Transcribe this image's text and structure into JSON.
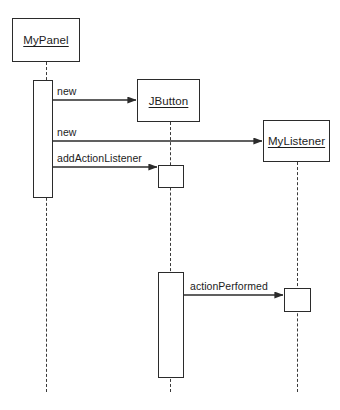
{
  "diagram": {
    "kind": "uml-sequence-diagram",
    "title": "",
    "canvas": {
      "width": 340,
      "height": 410
    },
    "colors": {
      "background": "#ffffff",
      "stroke": "#2b2b2b",
      "lifeline_stroke": "#3a3a3a",
      "text": "#1c1c1c",
      "fill": "#ffffff"
    },
    "participants": [
      {
        "id": "mypanel",
        "label": "MyPanel",
        "underlined": true,
        "box": {
          "x": 12,
          "y": 18,
          "w": 68,
          "h": 44
        },
        "lifeline_x": 46,
        "lifeline_end_y": 392
      },
      {
        "id": "jbutton",
        "label": "JButton",
        "underlined": true,
        "box": {
          "x": 137,
          "y": 79,
          "w": 63,
          "h": 43
        },
        "lifeline_x": 170,
        "lifeline_end_y": 392
      },
      {
        "id": "mylistener",
        "label": "MyListener",
        "underlined": true,
        "box": {
          "x": 263,
          "y": 120,
          "w": 67,
          "h": 42
        },
        "lifeline_x": 297,
        "lifeline_end_y": 392
      }
    ],
    "activations": [
      {
        "id": "act-mypanel-main",
        "participant": "mypanel",
        "x": 33,
        "y": 80,
        "w": 20,
        "h": 118
      },
      {
        "id": "act-jbutton-add",
        "participant": "jbutton",
        "x": 158,
        "y": 165,
        "w": 26,
        "h": 23
      },
      {
        "id": "act-jbutton-event",
        "participant": "jbutton",
        "x": 158,
        "y": 272,
        "w": 26,
        "h": 106
      },
      {
        "id": "act-mylistener-handler",
        "participant": "mylistener",
        "x": 284,
        "y": 288,
        "w": 27,
        "h": 24
      }
    ],
    "messages": [
      {
        "id": "msg-new-jbutton",
        "label": "new",
        "from": "mypanel",
        "to": "jbutton",
        "x1": 53,
        "x2": 137,
        "y": 100,
        "label_x": 57,
        "label_y": 85,
        "arrow": "filled"
      },
      {
        "id": "msg-new-mylistener",
        "label": "new",
        "from": "mypanel",
        "to": "mylistener",
        "x1": 53,
        "x2": 263,
        "y": 141,
        "label_x": 57,
        "label_y": 126,
        "arrow": "filled"
      },
      {
        "id": "msg-addactionlistener",
        "label": "addActionListener",
        "from": "mypanel",
        "to": "jbutton",
        "x1": 53,
        "x2": 158,
        "y": 167,
        "label_x": 57,
        "label_y": 152,
        "arrow": "filled"
      },
      {
        "id": "msg-actionperformed",
        "label": "actionPerformed",
        "from": "jbutton",
        "to": "mylistener",
        "x1": 184,
        "x2": 284,
        "y": 295,
        "label_x": 190,
        "label_y": 280,
        "arrow": "filled"
      }
    ]
  }
}
